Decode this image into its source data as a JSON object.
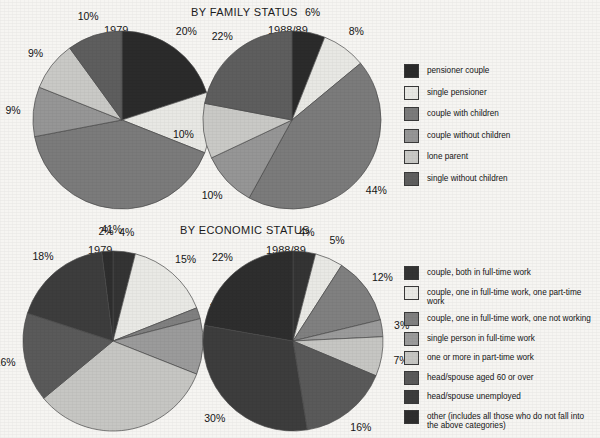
{
  "charts": {
    "family": {
      "title": "BY FAMILY STATUS",
      "years": {
        "left": "1979",
        "right": "1988/89"
      }
    },
    "economic": {
      "title": "BY ECONOMIC STATUS",
      "years": {
        "left": "1979",
        "right": "1988/89"
      }
    }
  },
  "legends": {
    "family": [
      {
        "label": "pensioner couple",
        "color": "#2b2b2b"
      },
      {
        "label": "single pensioner",
        "color": "#e8e8e4"
      },
      {
        "label": "couple with children",
        "color": "#7b7b7b"
      },
      {
        "label": "couple without children",
        "color": "#969696"
      },
      {
        "label": "lone parent",
        "color": "#c9c9c6"
      },
      {
        "label": "single without children",
        "color": "#5e5e5e"
      }
    ],
    "economic": [
      {
        "label": "couple, both in full-time work",
        "color": "#343434"
      },
      {
        "label": "couple, one in full-time work, one part-time work",
        "color": "#e9e9e5"
      },
      {
        "label": "couple, one in full-time work, one not working",
        "color": "#808080"
      },
      {
        "label": "single person in full-time work",
        "color": "#9b9b9b"
      },
      {
        "label": "one or more in part-time work",
        "color": "#c6c6c3"
      },
      {
        "label": "head/spouse aged 60 or over",
        "color": "#5a5a5a"
      },
      {
        "label": "head/spouse unemployed",
        "color": "#3d3d3d"
      },
      {
        "label": "other (includes all those who do not fall into\nthe above categories)",
        "color": "#2e2e2e"
      }
    ]
  },
  "chart_data": [
    {
      "type": "pie",
      "title": "BY FAMILY STATUS",
      "subtitle": "1979",
      "labels": [
        "pensioner couple",
        "single pensioner",
        "couple with children",
        "couple without children",
        "lone parent",
        "single without children"
      ],
      "values": [
        20,
        11,
        41,
        9,
        9,
        10
      ],
      "value_labels": [
        "20%",
        "11%",
        "41%",
        "9%",
        "9%",
        "10%"
      ],
      "colors": [
        "#2b2b2b",
        "#e8e8e4",
        "#7b7b7b",
        "#969696",
        "#c9c9c6",
        "#5e5e5e"
      ],
      "start_angle_deg": 0,
      "direction": "clockwise",
      "legend_position": "right"
    },
    {
      "type": "pie",
      "title": "BY FAMILY STATUS",
      "subtitle": "1988/89",
      "labels": [
        "pensioner couple",
        "single pensioner",
        "couple with children",
        "couple without children",
        "lone parent",
        "single without children"
      ],
      "values": [
        6,
        8,
        44,
        10,
        10,
        22
      ],
      "value_labels": [
        "6%",
        "8%",
        "44%",
        "10%",
        "10%",
        "22%"
      ],
      "colors": [
        "#2b2b2b",
        "#e8e8e4",
        "#7b7b7b",
        "#969696",
        "#c9c9c6",
        "#5e5e5e"
      ],
      "start_angle_deg": 0,
      "direction": "clockwise",
      "legend_position": "right"
    },
    {
      "type": "pie",
      "title": "BY ECONOMIC STATUS",
      "subtitle": "1979",
      "labels": [
        "couple, both in full-time work",
        "couple, one in full-time work, one part-time work",
        "couple, one in full-time work, one not working",
        "single person in full-time work",
        "one or more in part-time work",
        "head/spouse aged 60 or over",
        "head/spouse unemployed",
        "other (includes all those who do not fall into the above categories)"
      ],
      "values": [
        4,
        15,
        2,
        10,
        33,
        16,
        18,
        2
      ],
      "value_labels": [
        "4%",
        "15%",
        "2%",
        "10%",
        "33%",
        "16%",
        "18%",
        "2%"
      ],
      "colors": [
        "#343434",
        "#e9e9e5",
        "#808080",
        "#9b9b9b",
        "#c6c6c3",
        "#5a5a5a",
        "#3d3d3d",
        "#2e2e2e"
      ],
      "start_angle_deg": 0,
      "direction": "clockwise",
      "legend_position": "right"
    },
    {
      "type": "pie",
      "title": "BY ECONOMIC STATUS",
      "subtitle": "1988/89",
      "labels": [
        "couple, both in full-time work",
        "couple, one in full-time work, one part-time work",
        "couple, one in full-time work, one not working",
        "single person in full-time work",
        "one or more in part-time work",
        "head/spouse aged 60 or over",
        "head/spouse unemployed",
        "other (includes all those who do not fall into the above categories)"
      ],
      "values": [
        4,
        5,
        12,
        3,
        7,
        16,
        30,
        22
      ],
      "value_labels": [
        "4%",
        "5%",
        "12%",
        "3%",
        "7%",
        "16%",
        "30%",
        "22%"
      ],
      "colors": [
        "#343434",
        "#e9e9e5",
        "#808080",
        "#9b9b9b",
        "#c6c6c3",
        "#5a5a5a",
        "#3d3d3d",
        "#2e2e2e"
      ],
      "start_angle_deg": 0,
      "direction": "clockwise",
      "legend_position": "right"
    }
  ]
}
